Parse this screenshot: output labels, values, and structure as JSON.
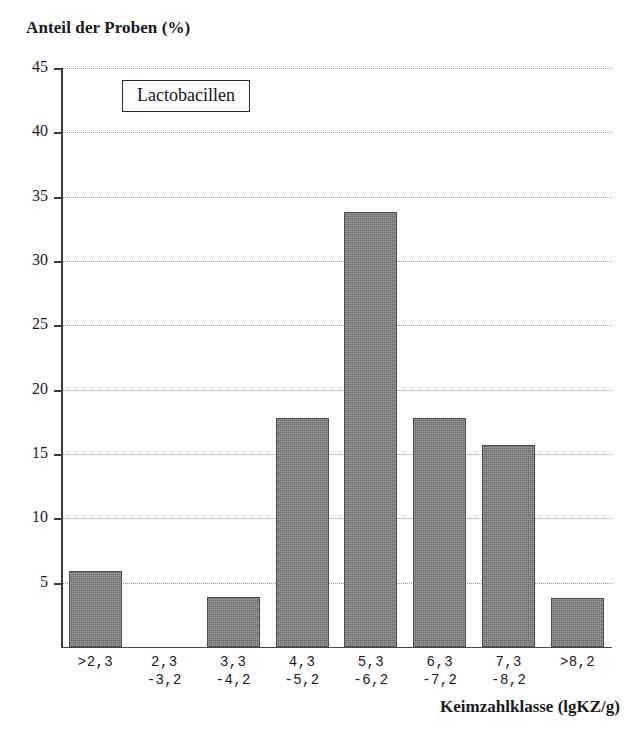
{
  "chart_data": {
    "type": "bar",
    "title": "",
    "ylabel": "Anteil der Proben (%)",
    "xlabel": "Keimzahlklasse (lgKZ/g)",
    "legend_label": "Lactobacillen",
    "legend_position": "inside-top-left",
    "grid": true,
    "ylim": [
      0,
      45
    ],
    "ytick_step": 5,
    "yticks": [
      45,
      40,
      35,
      30,
      25,
      20,
      15,
      10,
      5
    ],
    "ytick_labels": [
      "45",
      "40",
      "35",
      "30",
      "25",
      "20",
      "15",
      "10",
      "5"
    ],
    "categories": [
      ">2,3",
      "2,3 -3,2",
      "3,3 -4,2",
      "4,3 -5,2",
      "5,3 -6,2",
      "6,3 -7,2",
      "7,3 -8,2",
      ">8,2"
    ],
    "category_lines": [
      {
        "line1": ">2,3",
        "line2": ""
      },
      {
        "line1": "2,3",
        "line2": "-3,2"
      },
      {
        "line1": "3,3",
        "line2": "-4,2"
      },
      {
        "line1": "4,3",
        "line2": "-5,2"
      },
      {
        "line1": "5,3",
        "line2": "-6,2"
      },
      {
        "line1": "6,3",
        "line2": "-7,2"
      },
      {
        "line1": "7,3",
        "line2": "-8,2"
      },
      {
        "line1": ">8,2",
        "line2": ""
      }
    ],
    "values": [
      5.9,
      0,
      3.9,
      17.8,
      33.8,
      17.8,
      15.7,
      3.8
    ],
    "bar_color": "#808080",
    "bar_edge_color": "#4d4d4d",
    "grid_color": "#9a9a9a",
    "axis_color": "#3a3a3a",
    "text_color": "#1a1a1a"
  }
}
